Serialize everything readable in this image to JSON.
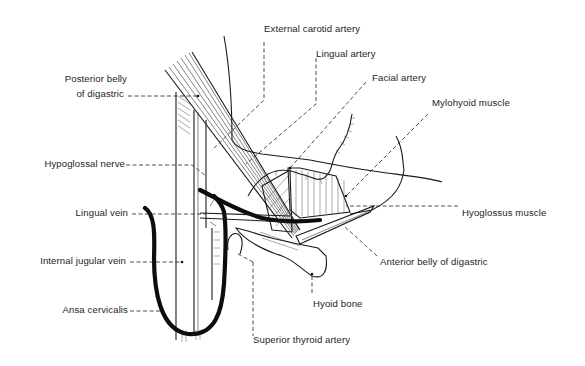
{
  "diagram": {
    "line_color": "#1a1a1a",
    "background": "#ffffff",
    "labels": {
      "external_carotid_artery": "External carotid artery",
      "lingual_artery": "Lingual artery",
      "facial_artery": "Facial artery",
      "mylohyoid_muscle": "Mylohyoid muscle",
      "posterior_belly_line1": "Posterior belly",
      "posterior_belly_line2": "of digastric",
      "hypoglossal_nerve": "Hypoglossal nerve",
      "lingual_vein": "Lingual vein",
      "hyoglossus_muscle": "Hyoglossus muscle",
      "internal_jugular_vein": "Internal jugular vein",
      "anterior_belly_of_digastric": "Anterior belly of digastric",
      "hyoid_bone": "Hyoid bone",
      "ansa_cervicalis": "Ansa cervicalis",
      "superior_thyroid_artery": "Superior thyroid artery"
    }
  }
}
